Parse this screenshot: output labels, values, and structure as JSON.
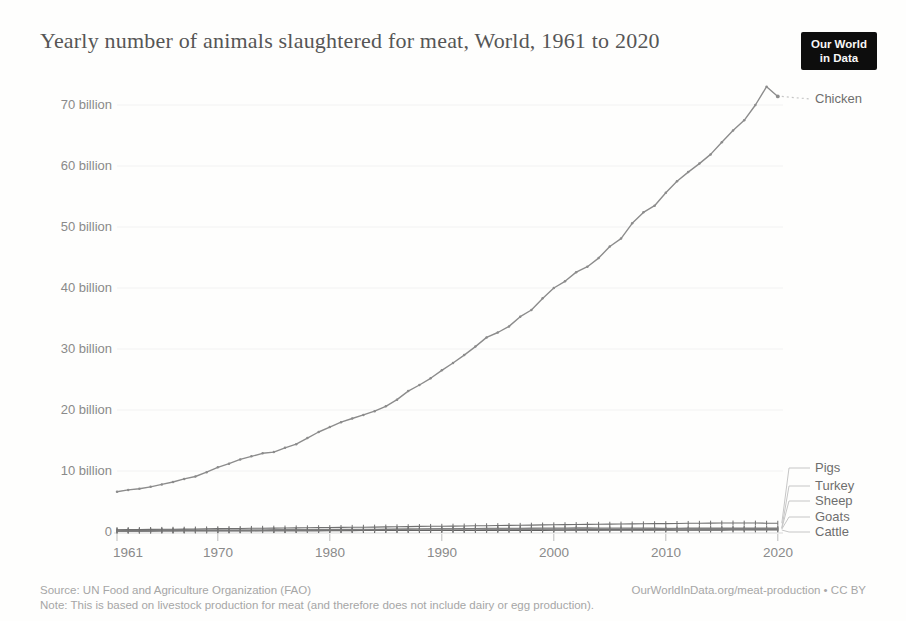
{
  "header": {
    "title": "Yearly number of animals slaughtered for meat, World, 1961 to 2020",
    "logo": [
      "Our World",
      "in Data"
    ]
  },
  "y_axis": {
    "labels": [
      "70 billion",
      "60 billion",
      "50 billion",
      "40 billion",
      "30 billion",
      "20 billion",
      "10 billion",
      "0"
    ]
  },
  "x_axis": {
    "labels": [
      "1961",
      "1970",
      "1980",
      "1990",
      "2000",
      "2010",
      "2020"
    ]
  },
  "footer": {
    "source": "Source: UN Food and Agriculture Organization (FAO)",
    "license": "OurWorldInData.org/meat-production • CC BY",
    "note": "Note: This is based on livestock production for meat (and therefore does not include dairy or egg production)."
  },
  "chart_data": {
    "type": "line",
    "title": "Yearly number of animals slaughtered for meat, World, 1961 to 2020",
    "unit": "billion animals",
    "xlabel": "",
    "ylabel": "",
    "xlim": [
      1961,
      2020
    ],
    "ylim": [
      0,
      75
    ],
    "xticks": [
      1961,
      1970,
      1980,
      1990,
      2000,
      2010,
      2020
    ],
    "yticks": [
      0,
      10,
      20,
      30,
      40,
      50,
      60,
      70
    ],
    "grid": false,
    "legend_position": "right-of-line-ends",
    "years": [
      1961,
      1962,
      1963,
      1964,
      1965,
      1966,
      1967,
      1968,
      1969,
      1970,
      1971,
      1972,
      1973,
      1974,
      1975,
      1976,
      1977,
      1978,
      1979,
      1980,
      1981,
      1982,
      1983,
      1984,
      1985,
      1986,
      1987,
      1988,
      1989,
      1990,
      1991,
      1992,
      1993,
      1994,
      1995,
      1996,
      1997,
      1998,
      1999,
      2000,
      2001,
      2002,
      2003,
      2004,
      2005,
      2006,
      2007,
      2008,
      2009,
      2010,
      2011,
      2012,
      2013,
      2014,
      2015,
      2016,
      2017,
      2018,
      2019,
      2020
    ],
    "series": [
      {
        "name": "Chicken",
        "color": "#8c8c8c",
        "marker": "dot",
        "values": [
          6.6,
          6.9,
          7.1,
          7.4,
          7.8,
          8.2,
          8.7,
          9.1,
          9.8,
          10.6,
          11.2,
          11.9,
          12.4,
          12.9,
          13.1,
          13.8,
          14.4,
          15.4,
          16.4,
          17.2,
          18.0,
          18.6,
          19.2,
          19.8,
          20.6,
          21.7,
          23.1,
          24.1,
          25.2,
          26.5,
          27.7,
          29.0,
          30.4,
          31.9,
          32.7,
          33.7,
          35.3,
          36.4,
          38.3,
          40.0,
          41.1,
          42.6,
          43.5,
          44.9,
          46.8,
          48.1,
          50.6,
          52.4,
          53.5,
          55.6,
          57.5,
          59.0,
          60.4,
          61.9,
          63.9,
          65.8,
          67.5,
          70.0,
          73.0,
          71.4
        ]
      },
      {
        "name": "Pigs",
        "color": "#707070",
        "marker": "tick",
        "values": [
          0.38,
          0.39,
          0.4,
          0.42,
          0.44,
          0.46,
          0.48,
          0.5,
          0.52,
          0.55,
          0.57,
          0.58,
          0.6,
          0.62,
          0.64,
          0.66,
          0.68,
          0.7,
          0.72,
          0.73,
          0.75,
          0.77,
          0.79,
          0.81,
          0.83,
          0.86,
          0.88,
          0.91,
          0.93,
          0.95,
          0.97,
          0.99,
          1.01,
          1.04,
          1.06,
          1.08,
          1.1,
          1.13,
          1.16,
          1.19,
          1.21,
          1.23,
          1.25,
          1.27,
          1.29,
          1.31,
          1.33,
          1.35,
          1.37,
          1.38,
          1.4,
          1.42,
          1.44,
          1.46,
          1.47,
          1.48,
          1.47,
          1.47,
          1.45,
          1.45
        ]
      },
      {
        "name": "Turkey",
        "color": "#7b7b7b",
        "marker": "tick",
        "values": [
          0.13,
          0.14,
          0.15,
          0.16,
          0.17,
          0.18,
          0.19,
          0.19,
          0.2,
          0.2,
          0.21,
          0.22,
          0.23,
          0.24,
          0.25,
          0.26,
          0.28,
          0.29,
          0.31,
          0.32,
          0.34,
          0.36,
          0.38,
          0.4,
          0.42,
          0.44,
          0.47,
          0.49,
          0.51,
          0.52,
          0.54,
          0.56,
          0.58,
          0.6,
          0.61,
          0.62,
          0.63,
          0.64,
          0.65,
          0.65,
          0.66,
          0.67,
          0.67,
          0.66,
          0.66,
          0.65,
          0.65,
          0.65,
          0.64,
          0.63,
          0.63,
          0.64,
          0.64,
          0.65,
          0.65,
          0.66,
          0.66,
          0.66,
          0.65,
          0.66
        ]
      },
      {
        "name": "Sheep",
        "color": "#868686",
        "marker": "tick",
        "values": [
          0.33,
          0.33,
          0.34,
          0.34,
          0.34,
          0.35,
          0.35,
          0.36,
          0.36,
          0.36,
          0.37,
          0.37,
          0.38,
          0.38,
          0.39,
          0.39,
          0.4,
          0.4,
          0.41,
          0.42,
          0.42,
          0.43,
          0.44,
          0.45,
          0.46,
          0.47,
          0.48,
          0.49,
          0.5,
          0.51,
          0.51,
          0.51,
          0.51,
          0.51,
          0.51,
          0.51,
          0.52,
          0.52,
          0.51,
          0.51,
          0.51,
          0.51,
          0.52,
          0.52,
          0.53,
          0.53,
          0.54,
          0.53,
          0.53,
          0.52,
          0.53,
          0.53,
          0.54,
          0.55,
          0.55,
          0.55,
          0.56,
          0.57,
          0.57,
          0.57
        ]
      },
      {
        "name": "Goats",
        "color": "#6a6a6a",
        "marker": "tick",
        "values": [
          0.17,
          0.18,
          0.18,
          0.18,
          0.19,
          0.19,
          0.19,
          0.2,
          0.2,
          0.2,
          0.2,
          0.21,
          0.21,
          0.22,
          0.22,
          0.22,
          0.23,
          0.23,
          0.23,
          0.24,
          0.24,
          0.25,
          0.26,
          0.26,
          0.27,
          0.28,
          0.29,
          0.29,
          0.3,
          0.31,
          0.32,
          0.32,
          0.33,
          0.34,
          0.35,
          0.35,
          0.36,
          0.37,
          0.37,
          0.38,
          0.38,
          0.39,
          0.39,
          0.4,
          0.41,
          0.41,
          0.42,
          0.42,
          0.43,
          0.43,
          0.44,
          0.44,
          0.45,
          0.45,
          0.46,
          0.46,
          0.47,
          0.47,
          0.48,
          0.48
        ]
      },
      {
        "name": "Cattle",
        "color": "#5c5c5c",
        "marker": "tick",
        "values": [
          0.17,
          0.18,
          0.18,
          0.18,
          0.19,
          0.19,
          0.2,
          0.2,
          0.2,
          0.21,
          0.21,
          0.21,
          0.21,
          0.22,
          0.23,
          0.23,
          0.23,
          0.23,
          0.23,
          0.23,
          0.23,
          0.23,
          0.24,
          0.24,
          0.24,
          0.24,
          0.25,
          0.25,
          0.25,
          0.25,
          0.25,
          0.25,
          0.25,
          0.26,
          0.26,
          0.26,
          0.27,
          0.27,
          0.27,
          0.28,
          0.28,
          0.28,
          0.28,
          0.29,
          0.29,
          0.29,
          0.3,
          0.3,
          0.3,
          0.3,
          0.3,
          0.3,
          0.31,
          0.31,
          0.31,
          0.32,
          0.32,
          0.33,
          0.33,
          0.33
        ]
      }
    ],
    "colors": {
      "axis": "#d9d9d9",
      "tick": "#bdbdbd",
      "label_text": "#8a8a8a",
      "legend_text": "#6e6e6e",
      "connector": "#c6c6c6"
    }
  }
}
